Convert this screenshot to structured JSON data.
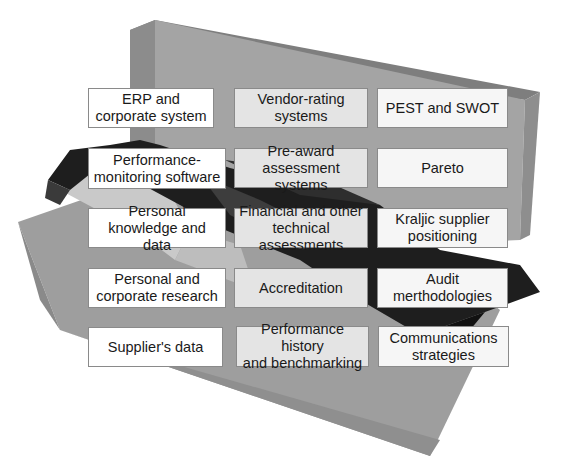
{
  "diagram": {
    "columns": [
      {
        "name": "data-sources",
        "items": [
          "ERP and\ncorporate system",
          "Performance-\nmonitoring software",
          "Personal\nknowledge and data",
          "Personal and\ncorporate research",
          "Supplier's data"
        ]
      },
      {
        "name": "assessment-tools",
        "items": [
          "Vendor-rating\nsystems",
          "Pre-award\nassessment systems",
          "Financial and other\ntechnical assessments",
          "Accreditation",
          "Performance history\nand benchmarking"
        ]
      },
      {
        "name": "analysis-methods",
        "items": [
          "PEST and SWOT",
          "Pareto",
          "Kraljic supplier\npositioning",
          "Audit\nmerthodologies",
          "Communications\nstrategies"
        ]
      }
    ],
    "colors": {
      "back_panel": "#9a9a9a",
      "back_panel_top": "#7e7e7e",
      "front_panel": "#a8a8a8",
      "dark_ribbon": "#1c1c1c",
      "light_ribbon": "#c8c8c8",
      "box_border": "#8a8a8a"
    }
  }
}
